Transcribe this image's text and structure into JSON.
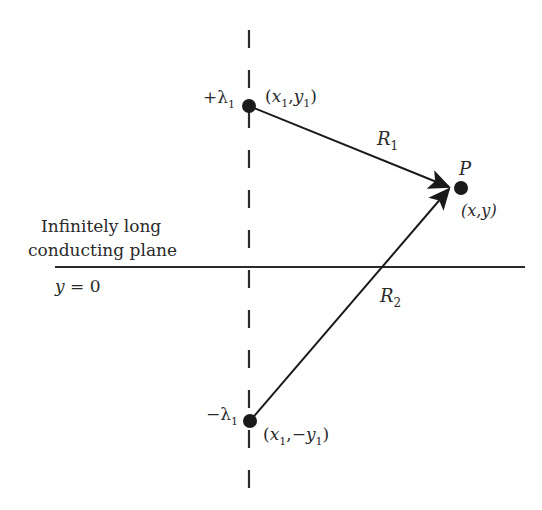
{
  "diagram": {
    "colors": {
      "ink": "#2a2a2a",
      "background": "#ffffff"
    },
    "plane": {
      "label_line1": "Infinitely long",
      "label_line2": "conducting plane",
      "equation_var": "y",
      "equation_rest": " = 0",
      "x_start": 55,
      "x_end": 525,
      "y": 267
    },
    "axis": {
      "style": "dashed",
      "x": 249,
      "y_start": 30,
      "y_end": 505
    },
    "charges": [
      {
        "id": "positive",
        "sign": "+",
        "symbol": "λ",
        "subscript": "1",
        "coord_prefix": "(",
        "coord_x": "x",
        "coord_x_sub": "1",
        "coord_sep": ",",
        "coord_y": "y",
        "coord_y_sub": "1",
        "coord_suffix": ")",
        "cx": 249,
        "cy": 106
      },
      {
        "id": "negative",
        "sign": "−",
        "symbol": "λ",
        "subscript": "1",
        "coord_prefix": "(",
        "coord_x": "x",
        "coord_x_sub": "1",
        "coord_sep": ",−",
        "coord_y": "y",
        "coord_y_sub": "1",
        "coord_suffix": ")",
        "cx": 250,
        "cy": 421
      }
    ],
    "point": {
      "label": "P",
      "coord_text": "(x,y)",
      "cx": 461,
      "cy": 188
    },
    "vectors": [
      {
        "label": "R",
        "subscript": "1",
        "from": "positive",
        "to": "P"
      },
      {
        "label": "R",
        "subscript": "2",
        "from": "negative",
        "to": "P"
      }
    ]
  }
}
